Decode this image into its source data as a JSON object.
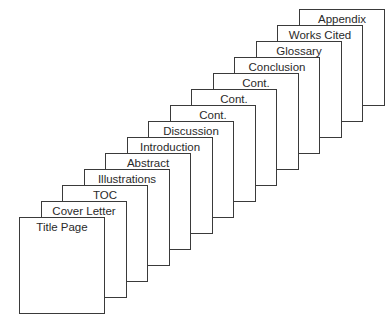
{
  "diagram": {
    "type": "stacked-pages",
    "pages": [
      {
        "label": "Title Page"
      },
      {
        "label": "Cover Letter"
      },
      {
        "label": "TOC"
      },
      {
        "label": "Illustrations"
      },
      {
        "label": "Abstract"
      },
      {
        "label": "Introduction"
      },
      {
        "label": "Discussion"
      },
      {
        "label": "Cont."
      },
      {
        "label": "Cont."
      },
      {
        "label": "Cont."
      },
      {
        "label": "Conclusion"
      },
      {
        "label": "Glossary"
      },
      {
        "label": "Works Cited"
      },
      {
        "label": "Appendix"
      }
    ],
    "colors": {
      "line": "#3a3a3a",
      "text": "#2a2a2a",
      "background": "#ffffff"
    }
  }
}
